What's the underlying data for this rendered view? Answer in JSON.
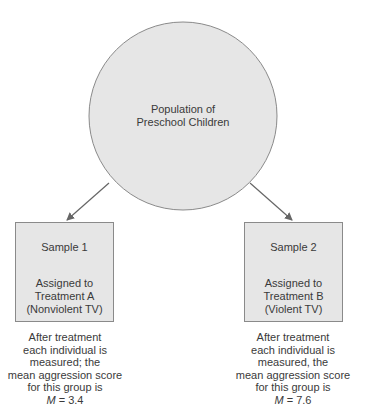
{
  "population": {
    "label_lines": [
      "Population of",
      "Preschool Children"
    ]
  },
  "samples": [
    {
      "title": "Sample 1",
      "assignment_lines": [
        "Assigned to",
        "Treatment A",
        "(Nonviolent TV)"
      ],
      "caption_lines": [
        "After treatment",
        "each individual is",
        "measured; the",
        "mean aggression score",
        "for this group is"
      ],
      "mean_symbol": "M",
      "mean_value": "= 3.4"
    },
    {
      "title": "Sample 2",
      "assignment_lines": [
        "Assigned to",
        "Treatment B",
        "(Violent TV)"
      ],
      "caption_lines": [
        "After treatment",
        "each individual is",
        "measured, the",
        "mean aggression score",
        "for this group is"
      ],
      "mean_symbol": "M",
      "mean_value": "= 7.6"
    }
  ],
  "colors": {
    "shape_fill": "#e6e6e6",
    "shape_stroke": "#8a8a8a",
    "arrow": "#666666",
    "text": "#3a3a3a"
  }
}
